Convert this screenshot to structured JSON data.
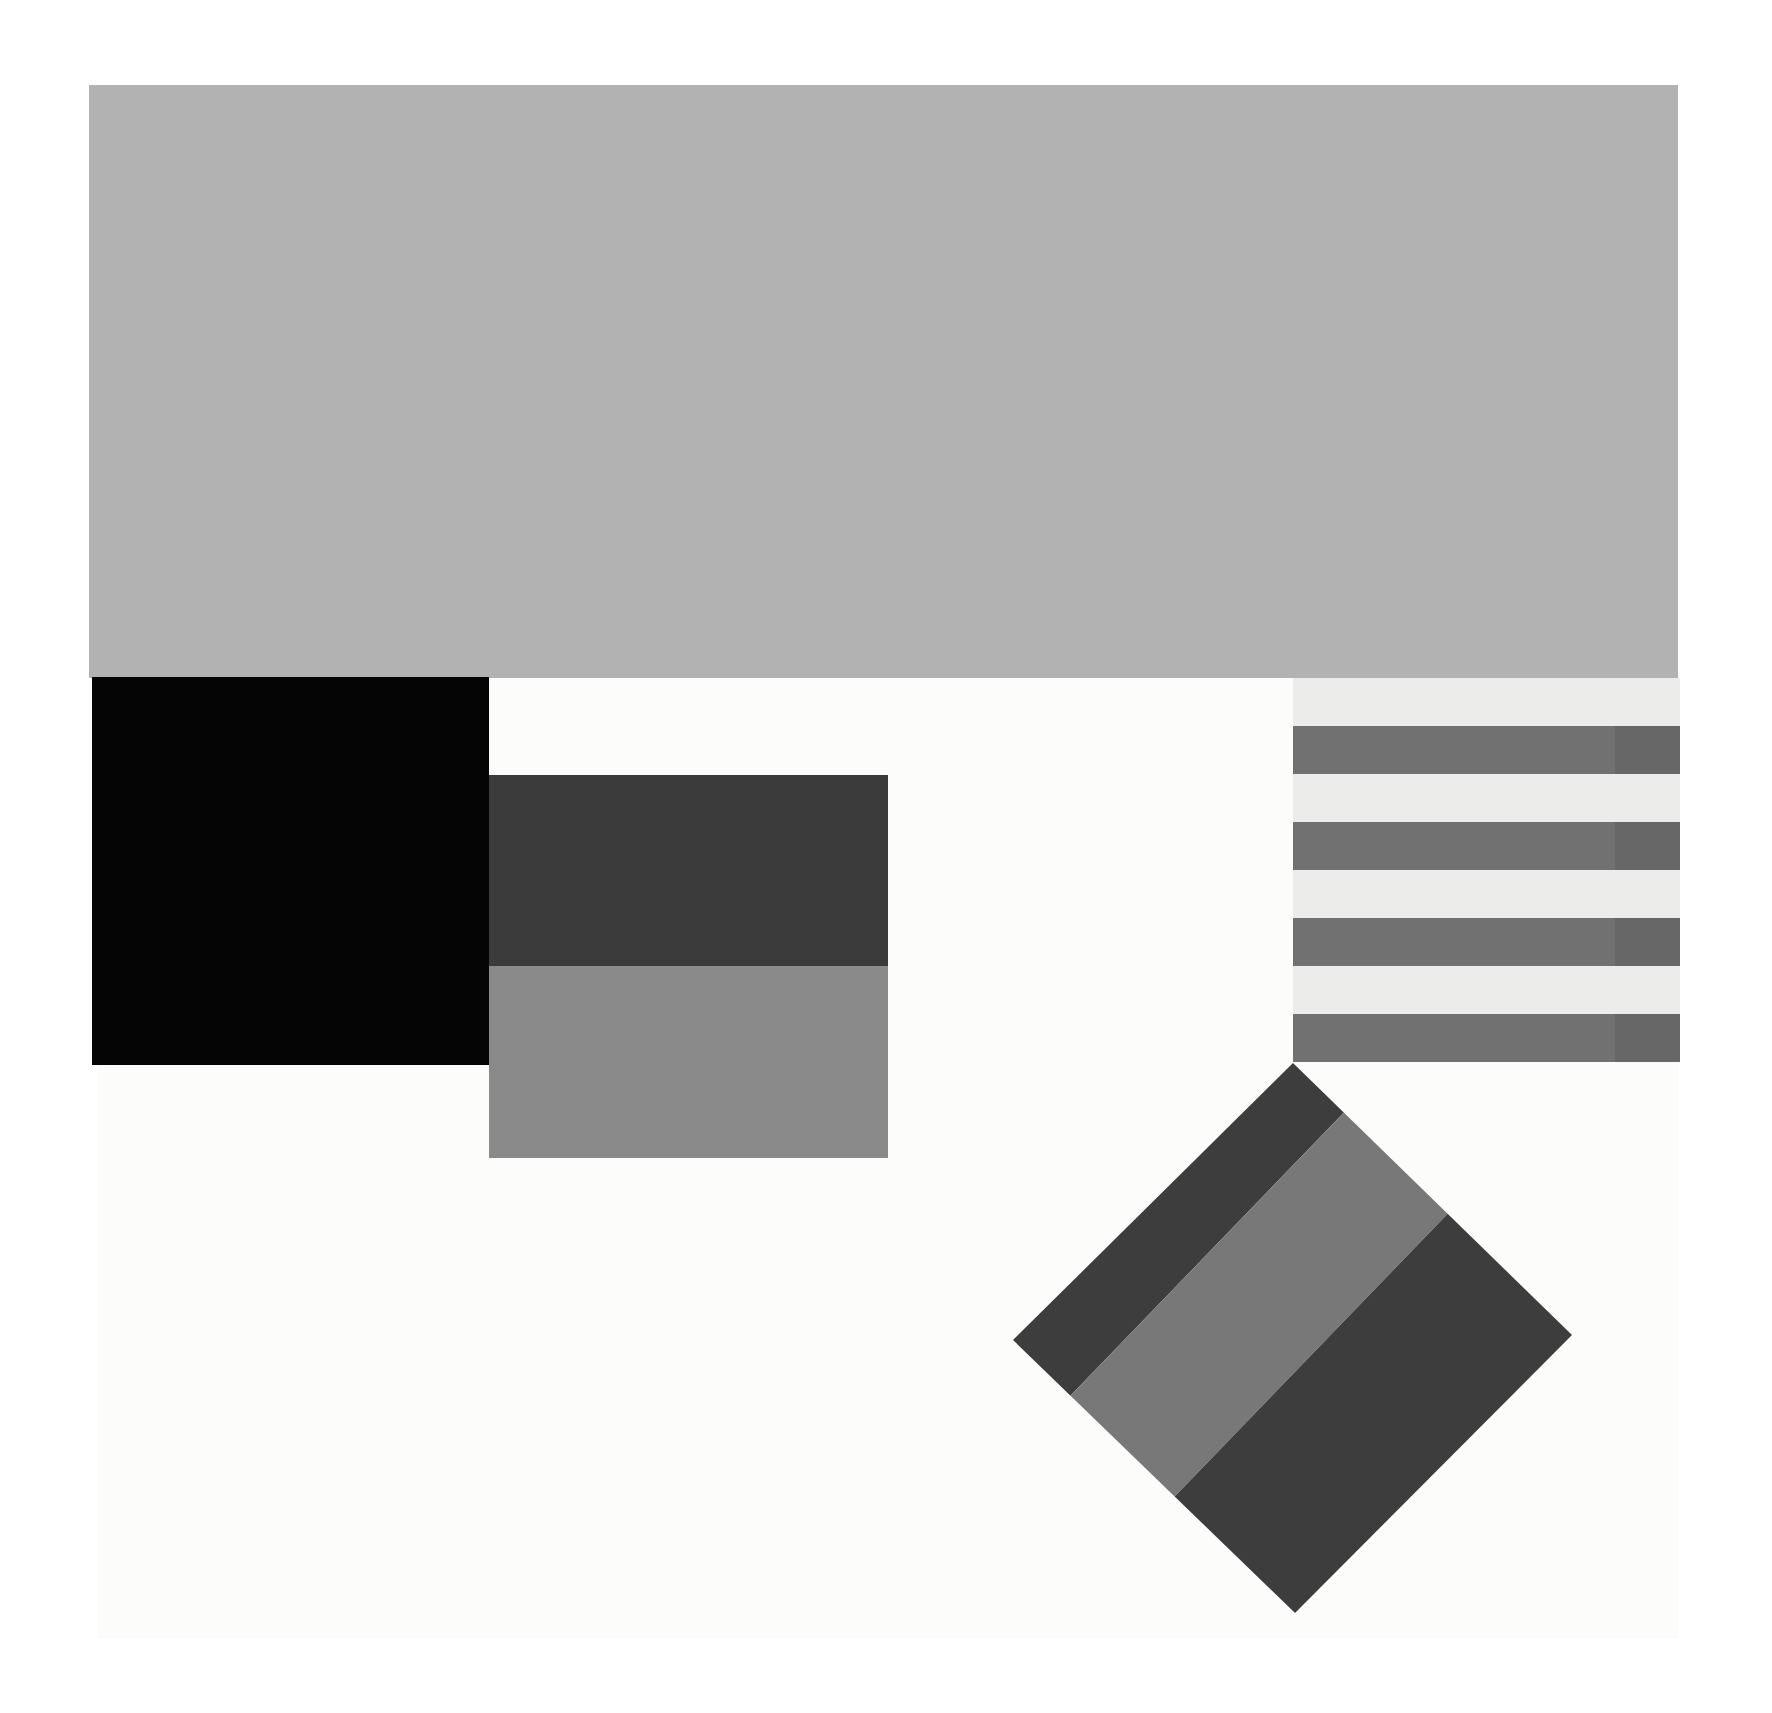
{
  "artwork": {
    "title": "Untitled geometric composition",
    "medium_note": "Flat-color hard-edge abstraction on off-white ground",
    "canvas": {
      "name": "paper-ground",
      "color": "#fcfcfb",
      "x": 97,
      "y": 86,
      "width": 1582,
      "height": 1553
    },
    "background_color": "#ffffff",
    "image_width": 1772,
    "image_height": 1713
  },
  "shapes": [
    {
      "id": "top-gray-band",
      "label": "Large light-gray rectangle",
      "form": "rectangle",
      "color": "#b2b2b2",
      "x": 89,
      "y": 85,
      "width": 1589,
      "height": 593
    },
    {
      "id": "black-square",
      "label": "Black square",
      "form": "square",
      "color": "#050505",
      "x": 92,
      "y": 677,
      "width": 397,
      "height": 388
    },
    {
      "id": "stack-dark",
      "label": "Dark-gray band of stacked rectangle",
      "form": "rectangle",
      "color": "#3b3b3b",
      "x": 489,
      "y": 775,
      "width": 399,
      "height": 191
    },
    {
      "id": "stack-mid",
      "label": "Medium-gray band of stacked rectangle",
      "form": "rectangle",
      "color": "#8a8a8a",
      "x": 489,
      "y": 966,
      "width": 399,
      "height": 192
    },
    {
      "id": "stripe-panel",
      "label": "Horizontal striped panel",
      "form": "striped-rectangle",
      "x": 1293,
      "y": 678,
      "width": 387,
      "height": 384
    },
    {
      "id": "diamond",
      "label": "Rotated striped square (diamond)",
      "form": "rotated-square",
      "rotation_deg": 44,
      "x": 1013,
      "y": 1063,
      "width": 559,
      "height": 550
    }
  ],
  "stripe_panel": {
    "background_color": "#ececea",
    "stripe_color_left": "#717171",
    "stripe_color_right": "#676767",
    "stripe_height": 48,
    "gap_height": 48,
    "split_x": 322,
    "stripe_count": 4,
    "rows": [
      {
        "index": 1,
        "top": 48
      },
      {
        "index": 2,
        "top": 144
      },
      {
        "index": 3,
        "top": 240
      },
      {
        "index": 4,
        "top": 336
      }
    ]
  },
  "diamond": {
    "vertices": {
      "top": {
        "x": 1293,
        "y": 1063
      },
      "right": {
        "x": 1572,
        "y": 1335
      },
      "bottom": {
        "x": 1295,
        "y": 1613
      },
      "left": {
        "x": 1013,
        "y": 1340
      }
    },
    "stripe_direction": "diagonal, parallel to upper-left edge",
    "bands": [
      {
        "index": 1,
        "color": "#787878",
        "label": "medium-gray band"
      },
      {
        "index": 2,
        "color": "#3d3d3d",
        "label": "dark-gray band"
      },
      {
        "index": 3,
        "color": "#787878",
        "label": "medium-gray band"
      },
      {
        "index": 4,
        "color": "#3d3d3d",
        "label": "dark-gray band"
      }
    ]
  },
  "palette": {
    "white": "#ffffff",
    "paper": "#fcfcfb",
    "off_white_stripe_bg": "#ececea",
    "light_gray": "#b2b2b2",
    "medium_gray": "#8a8a8a",
    "stripe_gray": "#717171",
    "stripe_gray_dark": "#676767",
    "diamond_medium": "#787878",
    "diamond_dark": "#3d3d3d",
    "dark_gray": "#3b3b3b",
    "black": "#050505"
  }
}
